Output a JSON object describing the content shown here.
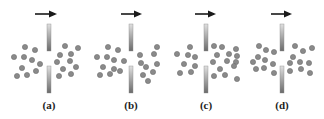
{
  "figure": {
    "colors": {
      "background": "#ffffff",
      "particle_fill": "#8a8a8a",
      "particle_stroke": "#6f6f6f",
      "barrier_light": "#e0e0e0",
      "barrier_dark": "#6a6a6a",
      "arrow": "#1a1a1a",
      "label": "#222222"
    },
    "panels": [
      {
        "label": "(a)",
        "cx": 49,
        "arrow": {
          "x1": 35,
          "x2": 58,
          "y": 14
        },
        "particles_left": [
          [
            25,
            47
          ],
          [
            35,
            50
          ],
          [
            14,
            57
          ],
          [
            24,
            57
          ],
          [
            32,
            60
          ],
          [
            40,
            64
          ],
          [
            22,
            68
          ],
          [
            36,
            71
          ],
          [
            17,
            76
          ],
          [
            27,
            75
          ]
        ],
        "particles_right": [
          [
            65,
            46
          ],
          [
            78,
            48
          ],
          [
            60,
            55
          ],
          [
            71,
            54
          ],
          [
            57,
            62
          ],
          [
            70,
            61
          ],
          [
            63,
            69
          ],
          [
            76,
            67
          ],
          [
            59,
            76
          ],
          [
            71,
            74
          ]
        ]
      },
      {
        "label": "(b)",
        "cx": 131,
        "arrow": {
          "x1": 121,
          "x2": 143,
          "y": 14
        },
        "particles_left": [
          [
            108,
            47
          ],
          [
            118,
            50
          ],
          [
            97,
            57
          ],
          [
            107,
            57
          ],
          [
            114,
            60
          ],
          [
            124,
            61
          ],
          [
            103,
            67
          ],
          [
            114,
            69
          ],
          [
            100,
            75
          ],
          [
            110,
            74
          ],
          [
            120,
            71
          ]
        ],
        "particles_right": [
          [
            140,
            55
          ],
          [
            154,
            54
          ],
          [
            157,
            47
          ],
          [
            141,
            63
          ],
          [
            146,
            67
          ],
          [
            157,
            64
          ],
          [
            143,
            75
          ],
          [
            153,
            72
          ],
          [
            148,
            81
          ]
        ]
      },
      {
        "label": "(c)",
        "cx": 206,
        "arrow": {
          "x1": 195,
          "x2": 217,
          "y": 14
        },
        "particles_left": [
          [
            190,
            47
          ],
          [
            177,
            54
          ],
          [
            188,
            55
          ],
          [
            195,
            57
          ],
          [
            184,
            64
          ],
          [
            195,
            66
          ],
          [
            180,
            73
          ],
          [
            191,
            72
          ]
        ],
        "particles_right": [
          [
            214,
            46
          ],
          [
            222,
            47
          ],
          [
            236,
            49
          ],
          [
            217,
            55
          ],
          [
            229,
            54
          ],
          [
            237,
            56
          ],
          [
            213,
            62
          ],
          [
            227,
            61
          ],
          [
            236,
            62
          ],
          [
            220,
            69
          ],
          [
            234,
            66
          ],
          [
            214,
            76
          ],
          [
            225,
            75
          ],
          [
            237,
            79
          ]
        ]
      },
      {
        "label": "(d)",
        "cx": 282,
        "arrow": {
          "x1": 271,
          "x2": 293,
          "y": 14
        },
        "particles_left": [
          [
            259,
            46
          ],
          [
            266,
            50
          ],
          [
            274,
            52
          ],
          [
            258,
            57
          ],
          [
            253,
            62
          ],
          [
            265,
            60
          ],
          [
            256,
            69
          ],
          [
            264,
            68
          ],
          [
            273,
            64
          ],
          [
            274,
            73
          ]
        ],
        "particles_right": [
          [
            295,
            46
          ],
          [
            303,
            51
          ],
          [
            312,
            48
          ],
          [
            293,
            57
          ],
          [
            290,
            63
          ],
          [
            300,
            62
          ],
          [
            309,
            63
          ],
          [
            290,
            71
          ],
          [
            301,
            69
          ],
          [
            310,
            73
          ]
        ]
      }
    ],
    "barrier": {
      "top_y1": 24,
      "top_y2": 51,
      "bottom_y1": 66,
      "bottom_y2": 93,
      "width": 4
    },
    "label_y": 109
  }
}
